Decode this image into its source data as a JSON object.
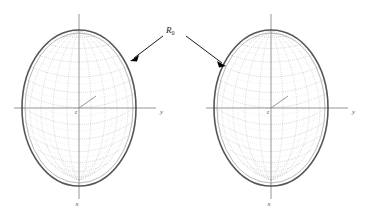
{
  "figure": {
    "type": "scientific-diagram",
    "background_color": "#ffffff",
    "annotation": {
      "label_base": "R",
      "label_subscript": "0",
      "label_full": "R0",
      "arrow_count": 2,
      "arrow_targets": [
        "left-ellipsoid-surface",
        "right-ellipsoid-surface"
      ],
      "color": "#000000"
    },
    "plots": [
      {
        "id": "left-plot",
        "name": "left-ellipsoid-plot",
        "center": {
          "x": 79,
          "y": 108
        },
        "semi_axis_horizontal": 57,
        "semi_axis_vertical": 78,
        "axes": [
          {
            "name": "y-axis",
            "label": "y",
            "direction": "right",
            "label_x": 160,
            "label_y": 114
          },
          {
            "name": "x-axis",
            "label": "x",
            "direction": "down",
            "label_x": 77,
            "label_y": 205
          },
          {
            "name": "z-axis",
            "label": "z",
            "direction": "origin",
            "label_x": 76,
            "label_y": 113
          }
        ],
        "mesh_latitude_lines": 11,
        "mesh_longitude_lines": 9,
        "surface_color": "#7a7a7a",
        "rim_color": "#3a3a3a"
      },
      {
        "id": "right-plot",
        "name": "right-ellipsoid-plot",
        "center": {
          "x": 271,
          "y": 108
        },
        "semi_axis_horizontal": 57,
        "semi_axis_vertical": 78,
        "axes": [
          {
            "name": "y-axis",
            "label": "y",
            "direction": "right",
            "label_x": 352,
            "label_y": 114
          },
          {
            "name": "x-axis",
            "label": "x",
            "direction": "down",
            "label_x": 269,
            "label_y": 205
          },
          {
            "name": "z-axis",
            "label": "z",
            "direction": "origin",
            "label_x": 268,
            "label_y": 113
          }
        ],
        "mesh_latitude_lines": 11,
        "mesh_longitude_lines": 9,
        "surface_color": "#7a7a7a",
        "rim_color": "#3a3a3a"
      }
    ],
    "colors": {
      "axis": "#8a8a8a",
      "mesh": "#7a7a7a",
      "rim": "#3a3a3a",
      "annotation": "#000000",
      "label": "#5a5a5a"
    }
  }
}
